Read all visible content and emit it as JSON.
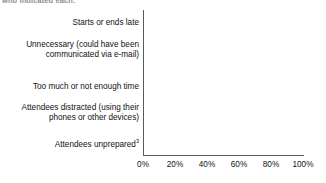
{
  "caption_fragment": "who indicated each:",
  "chart_data": {
    "type": "bar",
    "orientation": "horizontal",
    "title": "",
    "subtitle": "",
    "xlabel": "",
    "ylabel": "",
    "grid": false,
    "legend": null,
    "xlim": [
      0,
      100
    ],
    "xticks": [
      0,
      20,
      40,
      60,
      80,
      100
    ],
    "xtick_labels": [
      "0%",
      "20%",
      "40%",
      "60%",
      "80%",
      "100%"
    ],
    "bar_color": "#808080",
    "axis_color": "#5a5a5a",
    "categories": [
      "Starts or ends late",
      "Unnecessary (could have been communicated via e-mail)",
      "Too much or not enough time",
      "Attendees distracted (using their phones or other devices)",
      "Attendees unprepared"
    ],
    "category_lines": [
      [
        "Starts or ends late"
      ],
      [
        "Unnecessary (could have been",
        "communicated via e-mail)"
      ],
      [
        "Too much or not enough time"
      ],
      [
        "Attendees distracted (using their",
        "phones or other devices)"
      ],
      [
        "Attendees unprepared"
      ]
    ],
    "category_footnotes": [
      "",
      "",
      "",
      "",
      "3"
    ],
    "values": [
      65,
      64,
      58,
      58,
      47
    ],
    "value_labels": [
      "65%",
      "64%",
      "58%",
      "58%",
      "47%"
    ]
  }
}
